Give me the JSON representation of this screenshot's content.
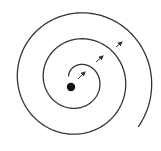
{
  "diagram": {
    "type": "spiral",
    "colors": {
      "background": "#ffffff",
      "stroke": "#333333",
      "dot": "#111111"
    },
    "spiral": {
      "center": [
        78,
        80
      ],
      "start_radius": 10,
      "growth_per_turn": 26,
      "turns": 2.55,
      "start_angle_deg": 200,
      "stroke_width": 1.3
    },
    "center_dot": {
      "cx": 71,
      "cy": 87,
      "r": 4.2
    },
    "arrows": [
      {
        "x1": 78,
        "y1": 79,
        "x2": 85,
        "y2": 72
      },
      {
        "x1": 96,
        "y1": 62,
        "x2": 103,
        "y2": 56
      },
      {
        "x1": 116,
        "y1": 47,
        "x2": 122,
        "y2": 42
      }
    ]
  }
}
